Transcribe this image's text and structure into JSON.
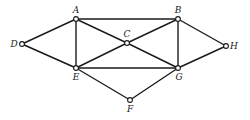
{
  "graph": {
    "nodes": [
      {
        "id": "A",
        "x": 76,
        "y": 19,
        "lx": 76,
        "ly": 13,
        "anchor": "middle"
      },
      {
        "id": "B",
        "x": 178,
        "y": 19,
        "lx": 178,
        "ly": 13,
        "anchor": "middle"
      },
      {
        "id": "C",
        "x": 127,
        "y": 43,
        "lx": 127,
        "ly": 37,
        "anchor": "middle"
      },
      {
        "id": "D",
        "x": 22,
        "y": 44,
        "lx": 14,
        "ly": 47,
        "anchor": "middle"
      },
      {
        "id": "E",
        "x": 76,
        "y": 68,
        "lx": 76,
        "ly": 80,
        "anchor": "middle"
      },
      {
        "id": "F",
        "x": 130,
        "y": 100,
        "lx": 130,
        "ly": 112,
        "anchor": "middle"
      },
      {
        "id": "G",
        "x": 178,
        "y": 68,
        "lx": 179,
        "ly": 80,
        "anchor": "middle"
      },
      {
        "id": "H",
        "x": 226,
        "y": 46,
        "lx": 234,
        "ly": 49,
        "anchor": "middle"
      }
    ],
    "edges": [
      [
        "A",
        "B"
      ],
      [
        "A",
        "D"
      ],
      [
        "A",
        "E"
      ],
      [
        "A",
        "C"
      ],
      [
        "B",
        "C"
      ],
      [
        "B",
        "G"
      ],
      [
        "B",
        "H"
      ],
      [
        "C",
        "E"
      ],
      [
        "C",
        "G"
      ],
      [
        "D",
        "E"
      ],
      [
        "E",
        "G"
      ],
      [
        "E",
        "F"
      ],
      [
        "F",
        "G"
      ],
      [
        "G",
        "H"
      ]
    ]
  }
}
